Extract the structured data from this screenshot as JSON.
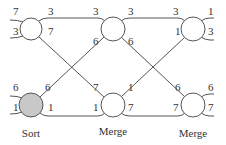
{
  "diagram": {
    "colors": {
      "line": "#555555",
      "text": "#333333",
      "sort_fill": "#c8c8c8",
      "merge_fill": "#ffffff"
    },
    "nodes": [
      {
        "id": "n1",
        "stage": "Sort",
        "cx": 31,
        "cy": 29,
        "r": 11,
        "filled": false,
        "in_top": "7",
        "in_bottom": "3",
        "out_top": "3",
        "out_bottom": "7"
      },
      {
        "id": "n2",
        "stage": "Sort",
        "cx": 31,
        "cy": 105,
        "r": 12,
        "filled": true,
        "in_top": "6",
        "in_bottom": "1",
        "out_top": "6",
        "out_bottom": "1"
      },
      {
        "id": "n3",
        "stage": "Merge",
        "cx": 113,
        "cy": 29,
        "r": 12,
        "filled": false,
        "in_top": "3",
        "in_bottom": "6",
        "out_top": "3",
        "out_bottom": "6"
      },
      {
        "id": "n4",
        "stage": "Merge",
        "cx": 113,
        "cy": 105,
        "r": 12,
        "filled": false,
        "in_top": "7",
        "in_bottom": "1",
        "out_top": "1",
        "out_bottom": "7"
      },
      {
        "id": "n5",
        "stage": "Merge",
        "cx": 193,
        "cy": 29,
        "r": 12,
        "filled": false,
        "in_top": "3",
        "in_bottom": "1",
        "out_top": "1",
        "out_bottom": "3"
      },
      {
        "id": "n6",
        "stage": "Merge",
        "cx": 193,
        "cy": 105,
        "r": 12,
        "filled": false,
        "in_top": "6",
        "in_bottom": "7",
        "out_top": "6",
        "out_bottom": "7"
      }
    ],
    "labels": {
      "n1_in_top": "7",
      "n1_in_bottom": "3",
      "n1_out_top": "3",
      "n1_out_bottom": "7",
      "n2_in_top": "6",
      "n2_in_bottom": "1",
      "n2_out_top": "6",
      "n2_out_bottom": "1",
      "n3_in_top": "3",
      "n3_in_bottom": "6",
      "n3_out_top": "3",
      "n3_out_bottom": "6",
      "n4_in_top": "7",
      "n4_in_bottom": "1",
      "n4_out_top": "1",
      "n4_out_bottom": "7",
      "n5_in_top": "3",
      "n5_in_bottom": "1",
      "n5_out_top": "1",
      "n5_out_bottom": "3",
      "n6_in_top": "6",
      "n6_in_bottom": "7",
      "n6_out_top": "6",
      "n6_out_bottom": "7"
    },
    "captions": {
      "col1": "Sort",
      "col2": "Merge",
      "col3": "Merge"
    }
  }
}
